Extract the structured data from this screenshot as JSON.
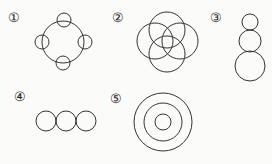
{
  "figures": [
    {
      "label": "①",
      "description": "large circle with four small circles at top, bottom, left, right"
    },
    {
      "label": "②",
      "description": "four overlapping circles in flower arrangement"
    },
    {
      "label": "③",
      "description": "three stacked circles increasing in size downward"
    },
    {
      "label": "④",
      "description": "three equal circles in a horizontal row, tangent"
    },
    {
      "label": "⑤",
      "description": "three concentric circles"
    }
  ],
  "colors": {
    "stroke": "#333333",
    "background": "#fbfbf9"
  }
}
